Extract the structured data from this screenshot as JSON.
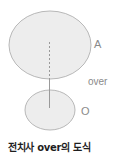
{
  "diagram": {
    "landmark_label": "A",
    "relation_label": "over",
    "trajector_label": "O",
    "caption": "전치사 over의 도식",
    "colors": {
      "ellipse_fill": "#ededed",
      "ellipse_stroke": "#b8b8b8",
      "line": "#9a9a9a",
      "label_text": "#8a8a8a",
      "caption_text": "#1e1e1e"
    }
  }
}
